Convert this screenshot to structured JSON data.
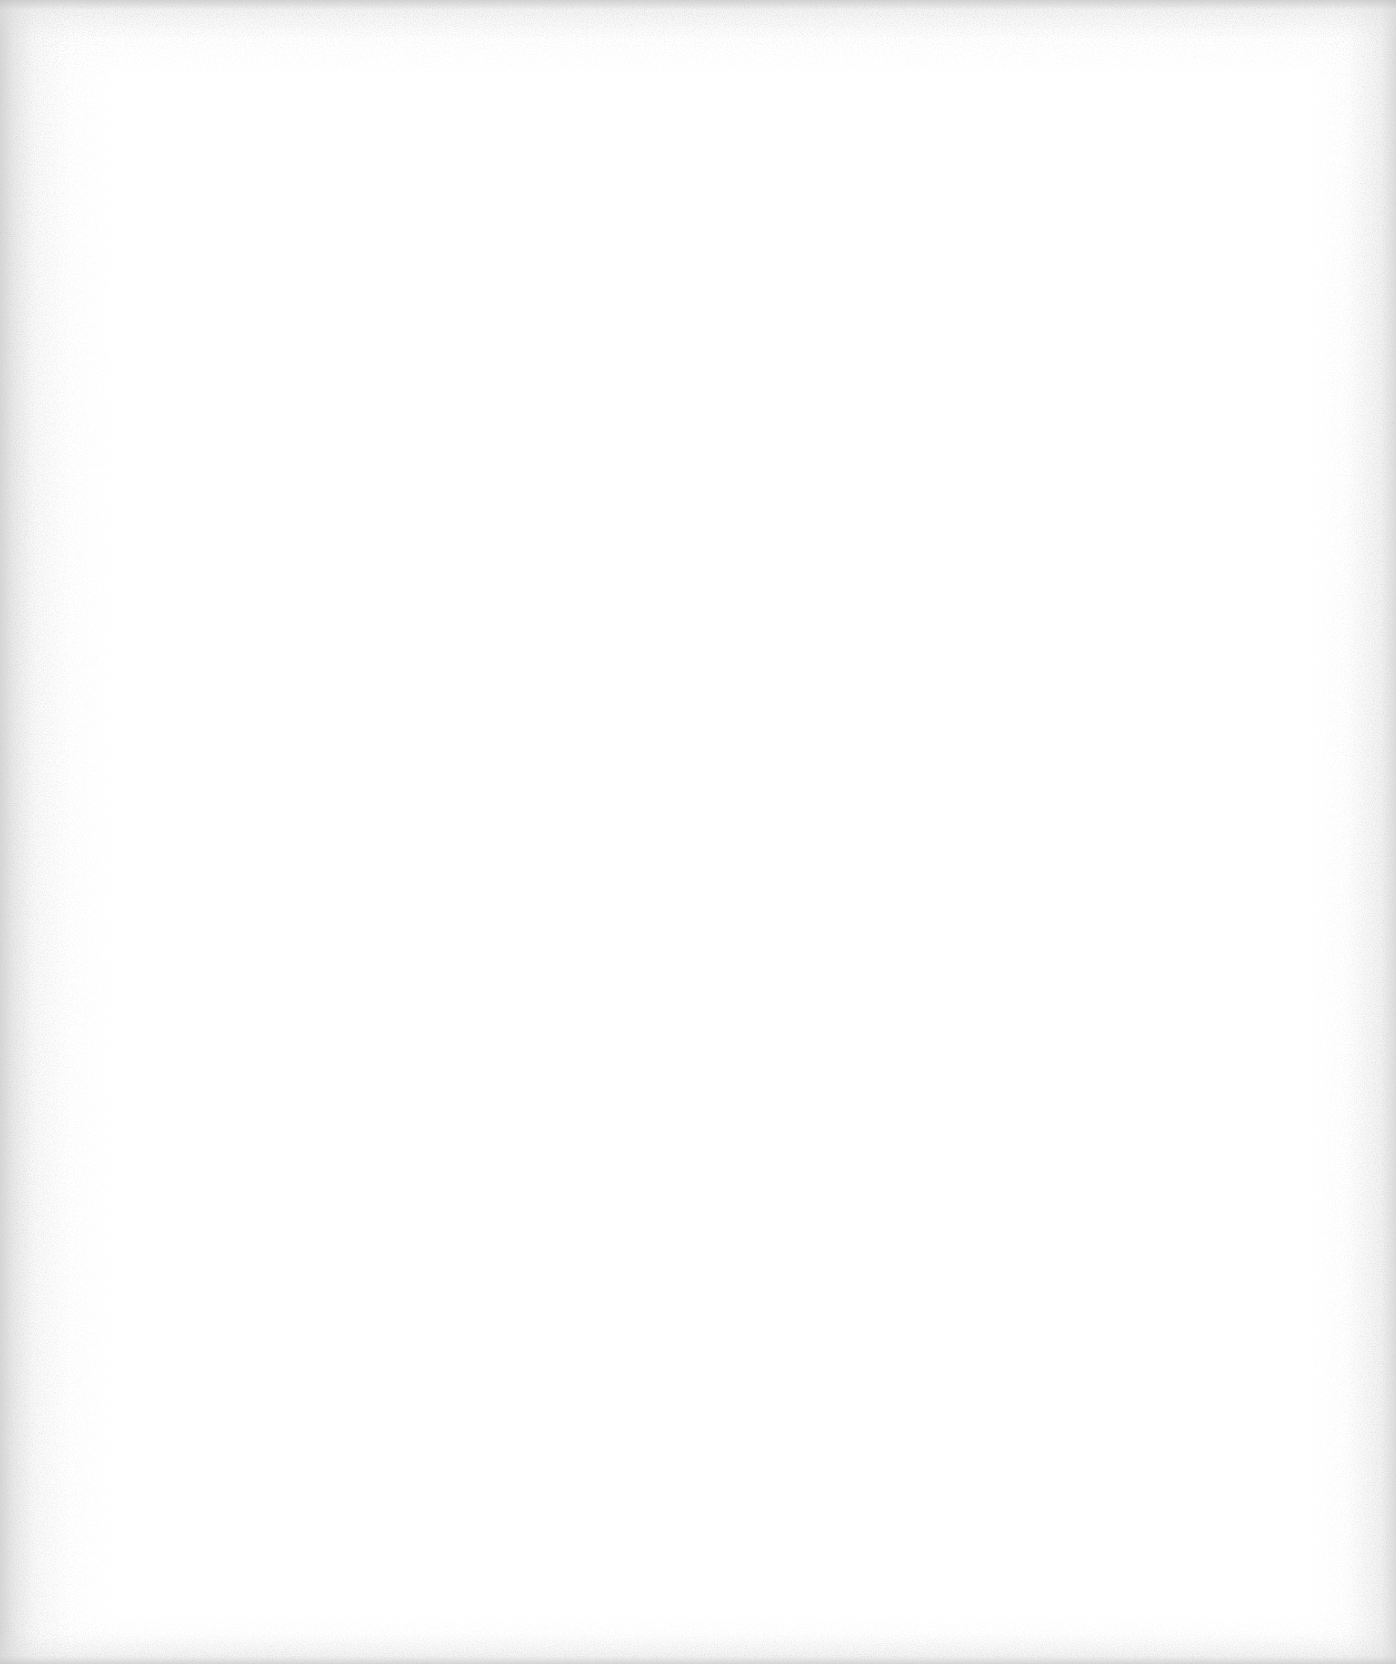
{
  "page": {
    "content": "",
    "background_color": "#ffffff",
    "edge_noise_color": "#c8c8c8"
  }
}
